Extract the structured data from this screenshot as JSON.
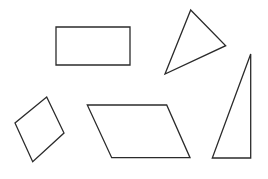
{
  "diagram": {
    "background": "#ffffff",
    "stroke_color": "#2b2b2b",
    "shapes": [
      {
        "name": "rectangle",
        "points": "56,27 130,27 130,65 56,65"
      },
      {
        "name": "acute-triangle",
        "points": "190.7,10 225.7,45.7 165,74"
      },
      {
        "name": "right-triangle",
        "points": "250.7,54 250.7,158 212.3,158"
      },
      {
        "name": "rhombus",
        "points": "46.7,97 64,133 32.7,161.7 15,123"
      },
      {
        "name": "parallelogram",
        "points": "87.3,105 166.7,105 190,157.7 111.7,157.7"
      }
    ]
  }
}
